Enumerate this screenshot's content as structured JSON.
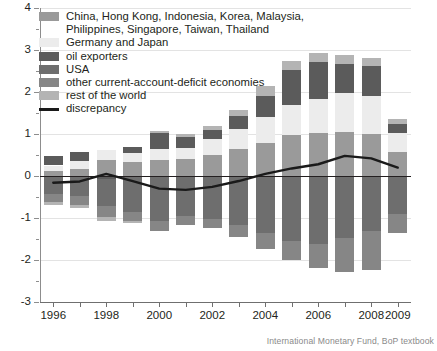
{
  "source_note": "International Monetary Fund, BoP textbook",
  "legend": {
    "items": [
      {
        "label": "China, Hong Kong, Indonesia, Korea, Malaysia,\nPhilippines, Singapore, Taiwan, Thailand",
        "color": "#9a9a9a",
        "type": "swatch",
        "key": "asia"
      },
      {
        "label": "Germany and Japan",
        "color": "#ececec",
        "type": "swatch",
        "key": "germany_japan"
      },
      {
        "label": "oil exporters",
        "color": "#5b5b5b",
        "type": "swatch",
        "key": "oil_exporters"
      },
      {
        "label": "USA",
        "color": "#6e6e6e",
        "type": "swatch",
        "key": "usa"
      },
      {
        "label": "other current-account-deficit economies",
        "color": "#868686",
        "type": "swatch",
        "key": "other_deficit"
      },
      {
        "label": "rest of the world",
        "color": "#b4b4b4",
        "type": "swatch",
        "key": "rest_of_world"
      },
      {
        "label": "discrepancy",
        "color": "#1a1a1a",
        "type": "line",
        "key": "discrepancy"
      }
    ]
  },
  "chart_data": {
    "type": "bar",
    "stacked": true,
    "title": "",
    "subtitle": "",
    "xlabel": "",
    "ylabel": "",
    "ylim": [
      -3,
      4
    ],
    "yticks": [
      -3,
      -2,
      -1,
      0,
      1,
      2,
      3,
      4
    ],
    "ytick_labels": [
      "-3",
      "-2",
      "-1",
      "0",
      "1",
      "2",
      "3",
      "4"
    ],
    "grid": true,
    "legend_position": "top-left",
    "categories": [
      1996,
      1997,
      1998,
      1999,
      2000,
      2001,
      2002,
      2003,
      2004,
      2005,
      2006,
      2007,
      2008,
      2009
    ],
    "xtick_labels": [
      "1996",
      "",
      "1998",
      "",
      "2000",
      "",
      "2002",
      "",
      "2004",
      "",
      "2006",
      "",
      "2008",
      "2009"
    ],
    "series": [
      {
        "name": "China, Hong Kong, Indonesia, Korea, Malaysia, Philippines, Singapore, Taiwan, Thailand",
        "color": "#9a9a9a",
        "values": [
          0.11,
          0.17,
          0.38,
          0.33,
          0.39,
          0.4,
          0.51,
          0.64,
          0.78,
          0.98,
          1.02,
          1.05,
          1.01,
          0.58
        ]
      },
      {
        "name": "Germany and Japan",
        "color": "#ececec",
        "values": [
          0.14,
          0.19,
          0.23,
          0.22,
          0.26,
          0.27,
          0.37,
          0.47,
          0.62,
          0.72,
          0.82,
          0.93,
          0.9,
          0.45
        ]
      },
      {
        "name": "oil exporters",
        "color": "#5b5b5b",
        "values": [
          0.22,
          0.21,
          -0.07,
          0.14,
          0.38,
          0.27,
          0.22,
          0.32,
          0.51,
          0.82,
          0.87,
          0.68,
          0.72,
          0.21
        ]
      },
      {
        "name": "USA",
        "color": "#6e6e6e",
        "values": [
          -0.43,
          -0.47,
          -0.64,
          -0.85,
          -1.07,
          -0.95,
          -1.02,
          -1.17,
          -1.35,
          -1.55,
          -1.62,
          -1.48,
          -1.3,
          -0.9
        ]
      },
      {
        "name": "other current-account-deficit economies",
        "color": "#868686",
        "values": [
          -0.19,
          -0.22,
          -0.27,
          -0.23,
          -0.24,
          -0.22,
          -0.23,
          -0.28,
          -0.38,
          -0.46,
          -0.58,
          -0.8,
          -0.95,
          -0.46
        ]
      },
      {
        "name": "rest of the world",
        "color": "#b4b4b4",
        "values": [
          -0.07,
          -0.08,
          -0.09,
          -0.05,
          0.05,
          0.06,
          0.09,
          0.15,
          0.23,
          0.22,
          0.21,
          0.21,
          0.19,
          0.12
        ]
      }
    ],
    "discrepancy": {
      "name": "discrepancy",
      "color": "#1a1a1a",
      "values": [
        -0.16,
        -0.13,
        0.05,
        -0.12,
        -0.3,
        -0.33,
        -0.26,
        -0.12,
        0.05,
        0.18,
        0.28,
        0.48,
        0.42,
        0.2
      ]
    }
  }
}
